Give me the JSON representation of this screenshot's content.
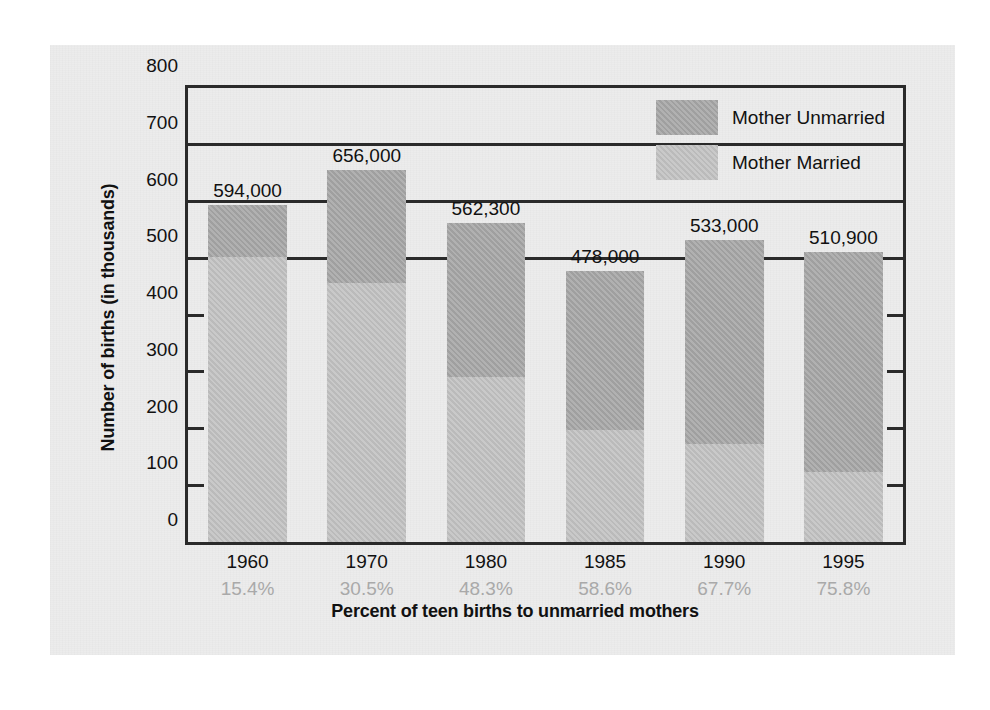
{
  "chart_data": {
    "type": "bar",
    "subtype": "stacked-bar",
    "title": "",
    "xlabel": "Percent of teen births to unmarried mothers",
    "ylabel": "Number of births (in thousands)",
    "ylim": [
      0,
      800
    ],
    "ytick_values": [
      0,
      100,
      200,
      300,
      400,
      500,
      600,
      700,
      800
    ],
    "ytick_labels": [
      "0",
      "100",
      "200",
      "300",
      "400",
      "500",
      "600",
      "700",
      "800"
    ],
    "grid": true,
    "legend_position": "top-right",
    "categories": [
      "1960",
      "1970",
      "1980",
      "1985",
      "1990",
      "1995"
    ],
    "secondary_tick_labels": [
      "15.4%",
      "30.5%",
      "48.3%",
      "58.6%",
      "67.7%",
      "75.8%"
    ],
    "totals": [
      594,
      656,
      562.3,
      478,
      533,
      510.9
    ],
    "total_labels": [
      "594,000",
      "656,000",
      "562,300",
      "478,000",
      "533,000",
      "510,900"
    ],
    "series": [
      {
        "name": "Mother Unmarried",
        "color": "#a8a8a8",
        "values": [
          91.5,
          200.1,
          271.6,
          280.1,
          360.8,
          387.3
        ]
      },
      {
        "name": "Mother Married",
        "color": "#c2c2c2",
        "values": [
          502.5,
          455.9,
          290.7,
          197.9,
          172.2,
          123.6
        ]
      }
    ],
    "annotations": []
  },
  "legend": {
    "items": [
      {
        "label": "Mother Unmarried",
        "swatch": "unmarried"
      },
      {
        "label": "Mother Married",
        "swatch": "married"
      }
    ]
  },
  "colors": {
    "unmarried": "#a8a8a8",
    "married": "#c2c2c2",
    "axis": "#2a2a2a",
    "panel": "#ececec",
    "percent_text": "#a9a9a9"
  }
}
